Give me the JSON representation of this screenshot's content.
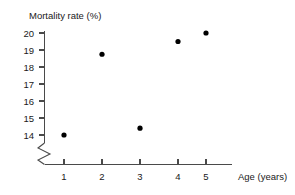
{
  "chart_data": {
    "type": "scatter",
    "title": "",
    "xlabel": "Age (years)",
    "ylabel": "Mortality rate (%)",
    "x": [
      1,
      2,
      3,
      4,
      5
    ],
    "values": [
      14.0,
      18.75,
      14.4,
      19.5,
      20.0
    ],
    "series": [
      {
        "name": "Mortality rate",
        "points": [
          {
            "x": 1,
            "y": 14.0
          },
          {
            "x": 2,
            "y": 18.75
          },
          {
            "x": 3,
            "y": 14.4
          },
          {
            "x": 4,
            "y": 19.5
          },
          {
            "x": 5,
            "y": 20.0
          }
        ],
        "marker": "filled-circle",
        "color": "#000000"
      }
    ],
    "xlim": [
      0.35,
      5.6
    ],
    "ylim": [
      13.6,
      20.35
    ],
    "xticks": [
      1,
      2,
      3,
      4,
      5
    ],
    "yticks": [
      14,
      15,
      16,
      17,
      18,
      19,
      20
    ],
    "xtick_labels": [
      "1",
      "2",
      "3",
      "4",
      "5"
    ],
    "ytick_labels": [
      "14",
      "15",
      "16",
      "17",
      "18",
      "19",
      "20"
    ],
    "grid": false,
    "legend": false,
    "legend_position": "none",
    "y_axis_break": true,
    "y_axis_break_note": "zigzag break below 14",
    "axis_color": "#4a4a4a",
    "background_color": "#ffffff"
  },
  "labels": {
    "y_axis_title": "Mortality rate (%)",
    "x_axis_title": "Age (years)",
    "y_tick_20": "20",
    "y_tick_19": "19",
    "y_tick_18": "18",
    "y_tick_17": "17",
    "y_tick_16": "16",
    "y_tick_15": "15",
    "y_tick_14": "14",
    "x_tick_1": "1",
    "x_tick_2": "2",
    "x_tick_3": "3",
    "x_tick_4": "4",
    "x_tick_5": "5"
  }
}
